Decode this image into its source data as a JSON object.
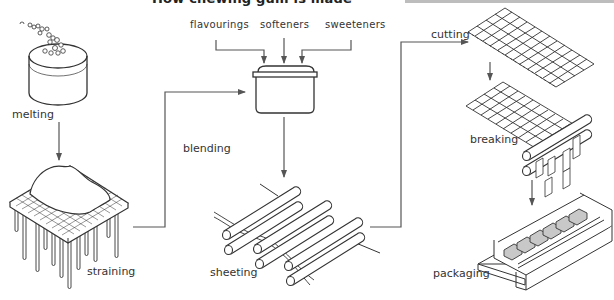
{
  "title": "How chewing gum is made",
  "ingredients": [
    "flavourings",
    "softeners",
    "sweeteners"
  ],
  "stages": [
    {
      "id": "melting",
      "label": "melting"
    },
    {
      "id": "straining",
      "label": "straining"
    },
    {
      "id": "blending",
      "label": "blending"
    },
    {
      "id": "sheeting",
      "label": "sheeting"
    },
    {
      "id": "cutting",
      "label": "cutting"
    },
    {
      "id": "breaking",
      "label": "breaking"
    },
    {
      "id": "packaging",
      "label": "packaging"
    }
  ],
  "flow": [
    "melting",
    "straining",
    "blending",
    "sheeting",
    "cutting",
    "breaking",
    "packaging"
  ],
  "colors": {
    "line": "#3a3a3a",
    "arrow": "#555555",
    "gum_fill": "#c8c8c8"
  }
}
